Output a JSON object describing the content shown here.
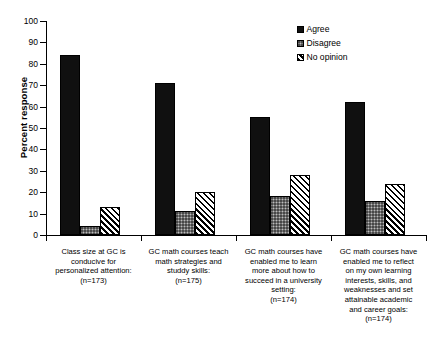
{
  "chart_data": {
    "type": "bar",
    "title": "",
    "xlabel": "",
    "ylabel": "Percent response",
    "ylim": [
      0,
      100
    ],
    "ytick_step": 10,
    "yticks": [
      0,
      10,
      20,
      30,
      40,
      50,
      60,
      70,
      80,
      90,
      100
    ],
    "grid": false,
    "legend_position": "top-right",
    "categories": [
      "Class size at GC is conducive for personalized attention: (n=173)",
      "GC math courses teach math strategies and studdy skills: (n=175)",
      "GC math courses have enabled me to learn more about how to succeed in a university setting: (n=174)",
      "GC math courses have enabled me to reflect on my own learning interests, skills, and weaknesses and set attainable academic and career goals: (n=174)"
    ],
    "category_lines": [
      [
        "Class size at GC is",
        "conducive for",
        "personalized attention:",
        "(n=173)"
      ],
      [
        "GC math courses teach",
        "math strategies and",
        "studdy skills:",
        "(n=175)"
      ],
      [
        "GC math courses have",
        "enabled me to learn",
        "more about how to",
        "succeed in a university",
        "setting:",
        "(n=174)"
      ],
      [
        "GC math courses have",
        "enabled me to reflect",
        "on my own learning",
        "interests, skills, and",
        "weaknesses and set",
        "attainable academic",
        "and career goals:",
        "(n=174)"
      ]
    ],
    "series": [
      {
        "name": "Agree",
        "pattern": "solid-black",
        "color": "#101010",
        "values": [
          84,
          71,
          55,
          62
        ]
      },
      {
        "name": "Disagree",
        "pattern": "gray-stipple",
        "color": "#787878",
        "values": [
          4,
          11,
          18,
          16
        ]
      },
      {
        "name": "No opinion",
        "pattern": "diagonal-hatch",
        "color": "#ffffff",
        "values": [
          13,
          20,
          28,
          24
        ]
      }
    ]
  },
  "legend": {
    "items": [
      {
        "label": "Agree"
      },
      {
        "label": "Disagree"
      },
      {
        "label": "No opinion"
      }
    ]
  },
  "axis": {
    "y_title": "Percent response"
  }
}
